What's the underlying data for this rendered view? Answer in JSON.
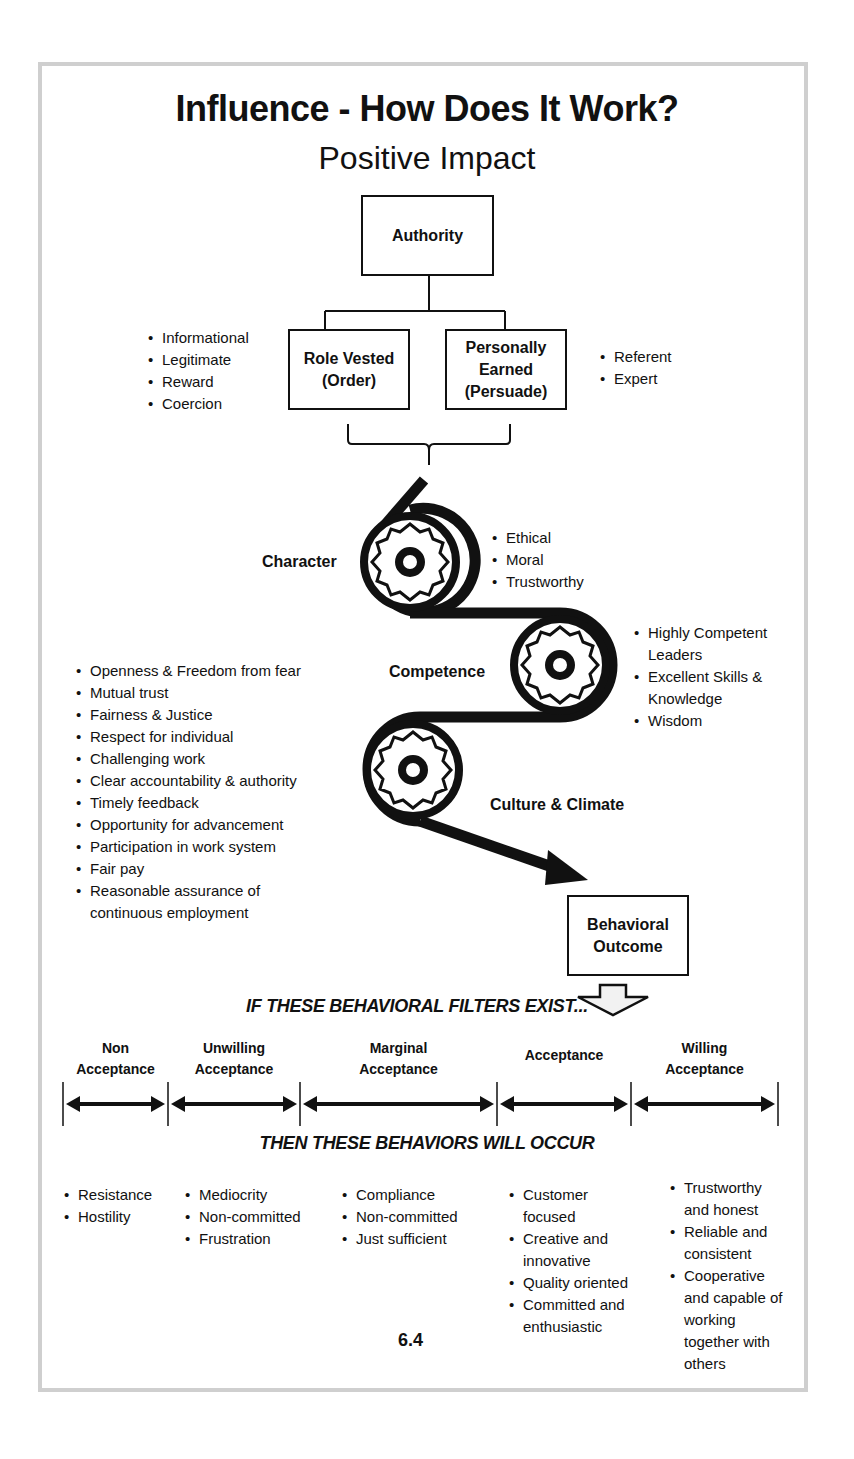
{
  "header": {
    "title": "Influence - How Does It Work?",
    "subtitle": "Positive Impact"
  },
  "authority": {
    "root_label": "Authority",
    "role_vested": {
      "line1": "Role Vested",
      "line2": "(Order)"
    },
    "personally_earned": {
      "line1": "Personally",
      "line2": "Earned",
      "line3": "(Persuade)"
    },
    "role_vested_items": [
      "Informational",
      "Legitimate",
      "Reward",
      "Coercion"
    ],
    "personally_earned_items": [
      "Referent",
      "Expert"
    ]
  },
  "gears": {
    "character": {
      "label": "Character",
      "items": [
        "Ethical",
        "Moral",
        "Trustworthy"
      ]
    },
    "competence": {
      "label": "Competence",
      "items": [
        "Highly Competent Leaders",
        "Excellent Skills & Knowledge",
        "Wisdom"
      ]
    },
    "culture": {
      "label": "Culture & Climate",
      "items": [
        "Openness & Freedom from  fear",
        "Mutual trust",
        "Fairness & Justice",
        "Respect for individual",
        "Challenging work",
        "Clear accountability & authority",
        "Timely feedback",
        "Opportunity for advancement",
        "Participation in work system",
        "Fair pay",
        "Reasonable assurance of continuous employment"
      ]
    }
  },
  "outcome": {
    "line1": "Behavioral",
    "line2": "Outcome"
  },
  "filters": {
    "if_heading": "IF THESE BEHAVIORAL FILTERS EXIST...",
    "then_heading": "THEN THESE BEHAVIORS WILL OCCUR",
    "categories": [
      {
        "line1": "Non",
        "line2": "Acceptance",
        "behaviors": [
          "Resistance",
          "Hostility"
        ]
      },
      {
        "line1": "Unwilling",
        "line2": "Acceptance",
        "behaviors": [
          "Mediocrity",
          "Non-committed",
          "Frustration"
        ]
      },
      {
        "line1": "Marginal",
        "line2": "Acceptance",
        "behaviors": [
          "Compliance",
          "Non-committed",
          "Just sufficient"
        ]
      },
      {
        "line1": "Acceptance",
        "line2": "",
        "behaviors": [
          "Customer focused",
          "Creative and innovative",
          "Quality oriented",
          "Committed and enthusiastic"
        ]
      },
      {
        "line1": "Willing",
        "line2": "Acceptance",
        "behaviors": [
          "Trustworthy and honest",
          "Reliable and consistent",
          "Cooperative and capable of working together with others"
        ]
      }
    ]
  },
  "footer": {
    "page_number": "6.4"
  }
}
